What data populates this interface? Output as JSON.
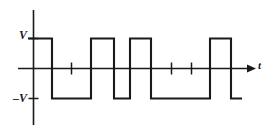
{
  "figure": {
    "title": "",
    "type": "waveform-plot",
    "background_color": "#ffffff",
    "line_color": "#1a1a1a"
  },
  "labels": {
    "v_positive": "V",
    "v_negative": "–V",
    "time_axis": "t"
  },
  "chart_data": {
    "type": "line",
    "title": "",
    "subtitle": "",
    "xlabel": "t",
    "ylabel": "V",
    "grid": false,
    "legend": null,
    "ylim": [
      -1,
      1
    ],
    "ytick_values": [
      1,
      0,
      -1
    ],
    "ytick_labels": [
      "V",
      "",
      "–V"
    ],
    "xlim": [
      0,
      10
    ],
    "xtick_values": [
      2,
      6,
      7
    ],
    "xtick_labels": [
      "",
      "",
      ""
    ],
    "levels": {
      "high": 1,
      "zero": 0,
      "low": -1
    },
    "transitions_x": [
      0,
      1.2,
      3.15,
      4.3,
      5.1,
      6.15,
      9.1,
      10.15,
      10.7
    ],
    "segments": [
      {
        "from_x": 0,
        "to_x": 1.2,
        "level": 1
      },
      {
        "from_x": 1.2,
        "to_x": 3.15,
        "level": -1
      },
      {
        "from_x": 3.15,
        "to_x": 4.3,
        "level": 1
      },
      {
        "from_x": 4.3,
        "to_x": 5.1,
        "level": -1
      },
      {
        "from_x": 5.1,
        "to_x": 6.15,
        "level": 1
      },
      {
        "from_x": 6.15,
        "to_x": 9.1,
        "level": -1
      },
      {
        "from_x": 9.1,
        "to_x": 10.15,
        "level": 1
      },
      {
        "from_x": 10.15,
        "to_x": 10.7,
        "level": -1
      }
    ],
    "bit_pattern": [
      "1",
      "0",
      "0",
      "1",
      "0",
      "1",
      "0",
      "0",
      "1",
      "0"
    ]
  }
}
